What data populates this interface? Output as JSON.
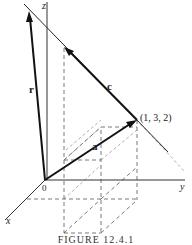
{
  "figure": {
    "caption": "FIGURE 12.4.1",
    "axes": {
      "x_label": "x",
      "y_label": "y",
      "z_label": "z",
      "origin_label": "0"
    },
    "point": {
      "label": "(1, 3, 2)"
    },
    "vectors": {
      "r_label": "r",
      "a_label": "a",
      "c_label": "c"
    }
  }
}
